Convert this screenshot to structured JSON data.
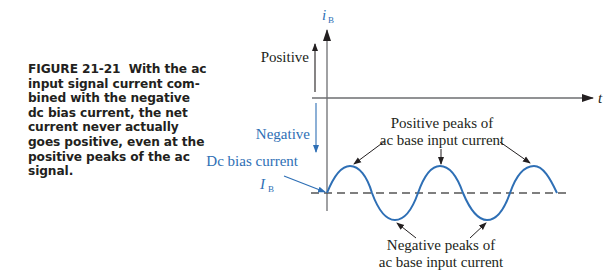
{
  "caption": {
    "figure_number": "FIGURE 21-21",
    "text": "With the ac input signal current com-bined with the negative dc bias current, the net current never actually goes positive, even at the positive peaks of the ac signal.",
    "lines": [
      "input signal current com-",
      "bined with the negative",
      "dc bias current, the net",
      "current never actually",
      "goes positive, even at the",
      "positive peaks of the ac",
      "signal."
    ],
    "first_line_rest": "With the ac"
  },
  "diagram": {
    "y_axis_label": "i",
    "y_axis_subscript": "B",
    "x_axis_label": "t",
    "positive_label": "Positive",
    "negative_label": "Negative",
    "dc_bias_label": "Dc bias current",
    "bias_symbol": "I",
    "bias_subscript": "B",
    "positive_peaks_line1": "Positive peaks of",
    "positive_peaks_line2": "ac base input current",
    "negative_peaks_line1": "Negative peaks of",
    "negative_peaks_line2": "ac base input current",
    "colors": {
      "blue": "#2e6fb5",
      "black": "#231f20",
      "dash": "#555555"
    }
  }
}
